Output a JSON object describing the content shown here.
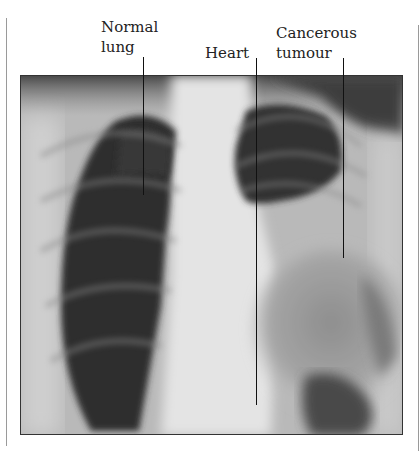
{
  "figure": {
    "labels": {
      "normal_lung_line1": "Normal",
      "normal_lung_line2": "lung",
      "heart": "Heart",
      "tumour_line1": "Cancerous",
      "tumour_line2": "tumour"
    },
    "colors": {
      "lung_dark": "#2e2e2e",
      "bone_light": "#e6e6e6",
      "soft_tissue": "#bdbdbd",
      "tumour_grey": "#9c9c9c",
      "leader_line": "#111111"
    }
  }
}
